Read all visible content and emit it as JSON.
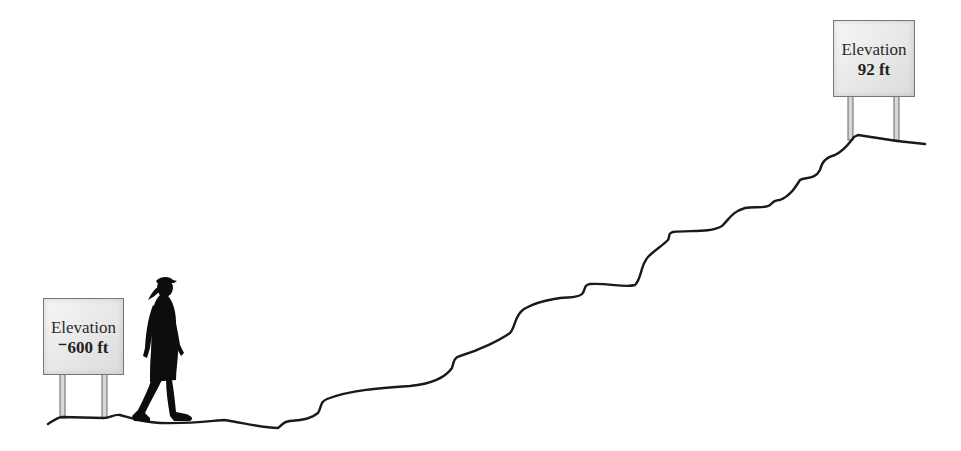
{
  "diagram": {
    "type": "elevation-illustration",
    "signs": [
      {
        "position": "start",
        "title": "Elevation",
        "value": "⁻600 ft"
      },
      {
        "position": "summit",
        "title": "Elevation",
        "value": "92 ft"
      }
    ],
    "figure": "hiker-silhouette",
    "terrain": "rising-hill-trail"
  },
  "colors": {
    "line": "#1a1a1a",
    "sign_fill": "#e9e9e9",
    "sign_border": "#777777",
    "silhouette": "#0d0d0d"
  }
}
